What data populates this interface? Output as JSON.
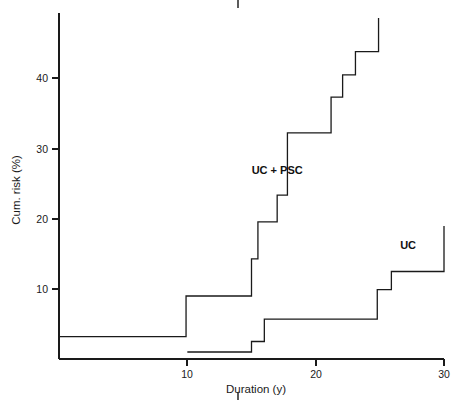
{
  "figure": {
    "background_color": "#ffffff",
    "ink_color": "#1a1a1a"
  },
  "chart_data": {
    "type": "line",
    "subtype": "kaplan-meier-step",
    "title": "",
    "xlabel": "Duration (y)",
    "ylabel": "Cum. risk (%)",
    "xlim": [
      0,
      30
    ],
    "ylim": [
      0,
      49
    ],
    "xticks": [
      10,
      20,
      30
    ],
    "xticklabels": [
      "10",
      "20",
      "30"
    ],
    "yticks": [
      10,
      20,
      30,
      40
    ],
    "yticklabels": [
      "10",
      "20",
      "30",
      "40"
    ],
    "grid": false,
    "legend_position": "inline-annotation",
    "annotations": [
      {
        "text": "UC + PSC",
        "x": 17.0,
        "y": 26.5
      },
      {
        "text": "UC",
        "x": 27.2,
        "y": 15.7
      }
    ],
    "series": [
      {
        "name": "UC + PSC",
        "label": "UC + PSC",
        "color": "#1a1a1a",
        "step": "post",
        "points": [
          {
            "x": 0.0,
            "y": 3.2
          },
          {
            "x": 9.9,
            "y": 3.2
          },
          {
            "x": 9.9,
            "y": 9.0
          },
          {
            "x": 15.0,
            "y": 9.0
          },
          {
            "x": 15.0,
            "y": 14.3
          },
          {
            "x": 15.5,
            "y": 14.3
          },
          {
            "x": 15.5,
            "y": 19.6
          },
          {
            "x": 17.0,
            "y": 19.6
          },
          {
            "x": 17.0,
            "y": 23.4
          },
          {
            "x": 17.8,
            "y": 23.4
          },
          {
            "x": 17.8,
            "y": 32.3
          },
          {
            "x": 21.2,
            "y": 32.3
          },
          {
            "x": 21.2,
            "y": 37.4
          },
          {
            "x": 22.1,
            "y": 37.4
          },
          {
            "x": 22.1,
            "y": 40.6
          },
          {
            "x": 23.1,
            "y": 40.6
          },
          {
            "x": 23.1,
            "y": 43.9
          },
          {
            "x": 24.9,
            "y": 43.9
          },
          {
            "x": 24.9,
            "y": 48.7
          }
        ]
      },
      {
        "name": "UC",
        "label": "UC",
        "color": "#1a1a1a",
        "step": "post",
        "points": [
          {
            "x": 10.0,
            "y": 1.0
          },
          {
            "x": 15.0,
            "y": 1.0
          },
          {
            "x": 15.0,
            "y": 2.5
          },
          {
            "x": 16.0,
            "y": 2.5
          },
          {
            "x": 16.0,
            "y": 5.7
          },
          {
            "x": 24.8,
            "y": 5.7
          },
          {
            "x": 24.8,
            "y": 9.9
          },
          {
            "x": 25.9,
            "y": 9.9
          },
          {
            "x": 25.9,
            "y": 12.5
          },
          {
            "x": 30.0,
            "y": 12.5
          },
          {
            "x": 30.0,
            "y": 19.0
          }
        ]
      }
    ]
  },
  "crop_marks": {
    "top": {
      "present": true
    },
    "bottom": {
      "present": true
    }
  }
}
